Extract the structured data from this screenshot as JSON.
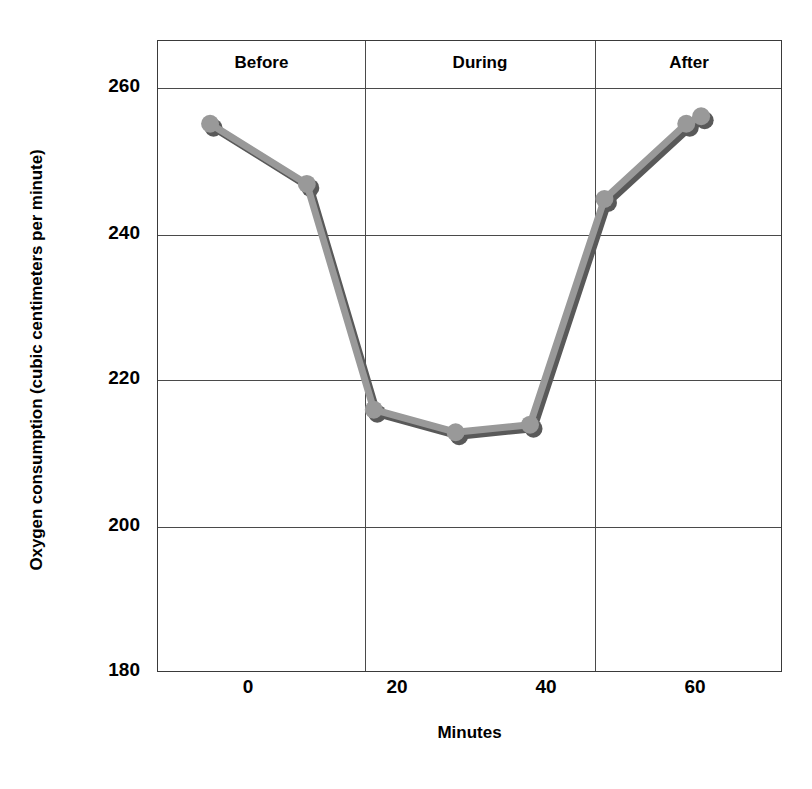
{
  "chart_data": {
    "type": "line",
    "title": "",
    "xlabel": "Minutes",
    "ylabel": "Oxygen consumption (cubic centimeters per minute)",
    "xlim": [
      -10,
      74
    ],
    "ylim": [
      180,
      264
    ],
    "xticks": [
      0,
      20,
      40,
      60
    ],
    "xticklabels": [
      "0",
      "20",
      "40",
      "60"
    ],
    "yticks": [
      180,
      200,
      220,
      240,
      260
    ],
    "yticklabels": [
      "180",
      "200",
      "220",
      "240",
      "260"
    ],
    "grid": "horizontal-gridlines-plus-two-vertical-phase-dividers",
    "legend": "none",
    "series": [
      {
        "name": "Oxygen consumption",
        "x": [
          -3,
          10,
          19,
          30,
          40,
          50,
          61,
          63
        ],
        "y": [
          253,
          245,
          215,
          212,
          213,
          243,
          253,
          254
        ],
        "marker": "circle",
        "line_color": "#999999",
        "shadow_color": "#595959"
      }
    ],
    "annotations": [
      {
        "label": "Before",
        "x_range": [
          -10,
          15.5
        ]
      },
      {
        "label": "During",
        "x_range": [
          15.5,
          46.5
        ]
      },
      {
        "label": "After",
        "x_range": [
          46.5,
          74
        ]
      }
    ],
    "phase_divider_x": [
      15.5,
      46.5
    ]
  },
  "axes": {
    "y_title": "Oxygen consumption (cubic centimeters per minute)",
    "x_title": "Minutes",
    "y_tick_labels": [
      "260",
      "240",
      "220",
      "200",
      "180"
    ],
    "x_tick_labels": [
      "0",
      "20",
      "40",
      "60"
    ]
  },
  "phases": {
    "before": "Before",
    "during": "During",
    "after": "After"
  },
  "colors": {
    "line": "#999999",
    "shadow": "#595959",
    "axis": "#3a3a3a",
    "grid": "#4a4a4a",
    "text": "#000000",
    "background": "#ffffff"
  }
}
